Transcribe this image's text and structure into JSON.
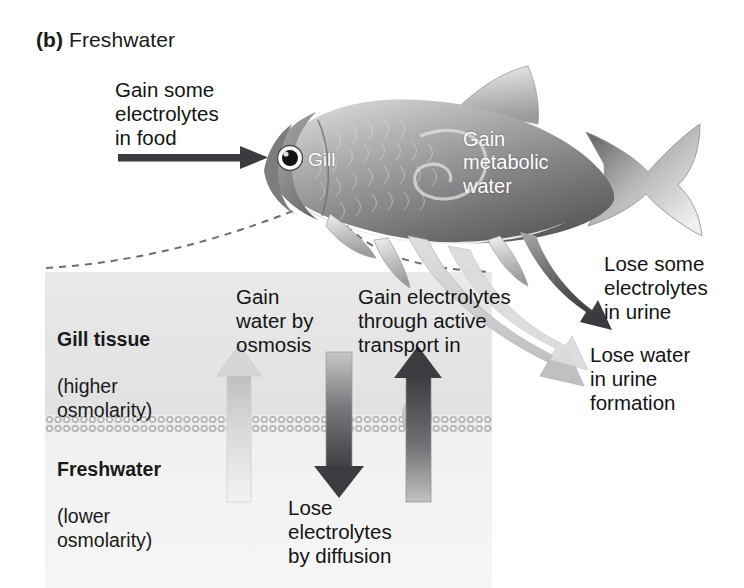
{
  "figure": {
    "panel_letter": "(b)",
    "panel_title": "Freshwater"
  },
  "fish_labels": {
    "gill": "Gill",
    "metabolic_water": "Gain\nmetabolic\nwater"
  },
  "callouts": {
    "food": "Gain some\nelectrolytes\nin food",
    "lose_electrolytes_urine": "Lose some\nelectrolytes\nin urine",
    "lose_water_urine": "Lose water\nin urine\nformation"
  },
  "inset": {
    "tissue": {
      "name": "Gill tissue",
      "detail": "(higher\nosmolarity)"
    },
    "medium": {
      "name": "Freshwater",
      "detail": "(lower\nosmolarity)"
    },
    "arrows": {
      "osmosis": "Gain\nwater by\nosmosis",
      "active_transport": "Gain electrolytes\nthrough active\ntransport in",
      "diffusion": "Lose\nelectrolytes\nby diffusion"
    }
  },
  "colors": {
    "text": "#141414",
    "white_label": "#ffffff",
    "dark_arrow": "#3b3b3f",
    "light_arrow": "#c9c9cb",
    "membrane": "#b9b9ba",
    "panel_bg": "#e9e9ea",
    "dashed_leader": "#6d6d70"
  }
}
